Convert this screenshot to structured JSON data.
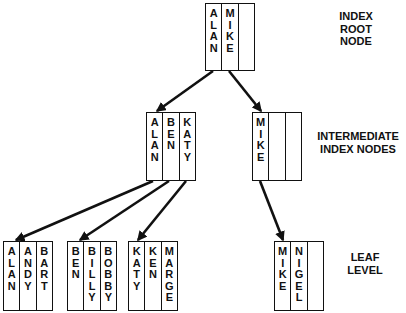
{
  "labels": {
    "root": [
      "INDEX",
      "ROOT",
      "NODE"
    ],
    "intermediate": [
      "INTERMEDIATE",
      "INDEX NODES"
    ],
    "leaf": [
      "LEAF",
      "LEVEL"
    ]
  },
  "nodes": {
    "root": {
      "x": 205,
      "y": 3,
      "w": 50,
      "h": 68,
      "keys": [
        "ALAN",
        "MIKE",
        ""
      ]
    },
    "intermediate": [
      {
        "x": 146,
        "y": 112,
        "w": 50,
        "h": 69,
        "keys": [
          "ALAN",
          "BEN",
          "KATY"
        ]
      },
      {
        "x": 252,
        "y": 112,
        "w": 50,
        "h": 69,
        "keys": [
          "MIKE",
          "",
          ""
        ]
      }
    ],
    "leaf": [
      {
        "x": 3,
        "y": 241,
        "w": 50,
        "h": 70,
        "keys": [
          "ALAN",
          "ANDY",
          "BART"
        ]
      },
      {
        "x": 67,
        "y": 241,
        "w": 50,
        "h": 70,
        "keys": [
          "BEN",
          "BILLY",
          "BOBBY"
        ]
      },
      {
        "x": 128,
        "y": 241,
        "w": 50,
        "h": 70,
        "keys": [
          "KATY",
          "KEN",
          "MARGE"
        ]
      },
      {
        "x": 274,
        "y": 241,
        "w": 50,
        "h": 70,
        "keys": [
          "MIKE",
          "NIGEL",
          ""
        ]
      }
    ]
  },
  "edges": [
    {
      "from": "root.ALAN",
      "to": "intermediate.0",
      "x1": 213,
      "y1": 71,
      "x2": 157,
      "y2": 111
    },
    {
      "from": "root.MIKE",
      "to": "intermediate.1",
      "x1": 229,
      "y1": 71,
      "x2": 261,
      "y2": 111
    },
    {
      "from": "intermediate.0.ALAN",
      "to": "leaf.0",
      "x1": 153,
      "y1": 181,
      "x2": 16,
      "y2": 240
    },
    {
      "from": "intermediate.0.BEN",
      "to": "leaf.1",
      "x1": 169,
      "y1": 181,
      "x2": 80,
      "y2": 240
    },
    {
      "from": "intermediate.0.KATY",
      "to": "leaf.2",
      "x1": 186,
      "y1": 181,
      "x2": 138,
      "y2": 240
    },
    {
      "from": "intermediate.1.MIKE",
      "to": "leaf.3",
      "x1": 260,
      "y1": 181,
      "x2": 283,
      "y2": 240
    }
  ],
  "colors": {
    "line": "#111111",
    "background": "#ffffff"
  }
}
